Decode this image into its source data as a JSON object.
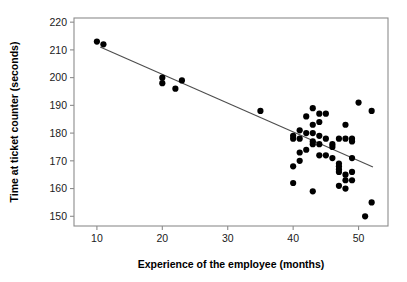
{
  "chart_data": {
    "type": "scatter",
    "title": "",
    "xlabel": "Experience of the employee (months)",
    "ylabel": "Time at ticket counter (seconds)",
    "xlim": [
      6.5,
      54.5
    ],
    "ylim": [
      146.5,
      221.5
    ],
    "xticks": [
      10,
      20,
      30,
      40,
      50
    ],
    "xtick_labels": [
      "10",
      "20",
      "30",
      "40",
      "50"
    ],
    "yticks": [
      150,
      160,
      170,
      180,
      190,
      200,
      210,
      220
    ],
    "ytick_labels": [
      "150",
      "160",
      "170",
      "180",
      "190",
      "200",
      "210",
      "220"
    ],
    "grid": false,
    "legend": false,
    "point_color": "#000000",
    "point_size": 3.1,
    "frame_color": "#8c8c8c",
    "series": [
      {
        "name": "Employees",
        "x": [
          10.0,
          11.0,
          20.0,
          20.0,
          22.0,
          23.0,
          35.0,
          40.0,
          40.0,
          40.0,
          40.0,
          41.0,
          41.0,
          41.0,
          41.0,
          42.0,
          42.0,
          42.0,
          43.0,
          43.0,
          43.0,
          43.0,
          43.0,
          43.0,
          44.0,
          44.0,
          44.0,
          44.0,
          44.0,
          45.0,
          45.0,
          45.0,
          46.0,
          46.0,
          46.0,
          47.0,
          47.0,
          47.0,
          47.0,
          47.0,
          47.0,
          48.0,
          48.0,
          48.0,
          48.0,
          48.0,
          49.0,
          49.0,
          49.0,
          49.0,
          49.0,
          50.0,
          51.0,
          52.0,
          52.0
        ],
        "y": [
          213.0,
          212.0,
          200.0,
          198.0,
          196.0,
          199.0,
          188.0,
          179.0,
          178.0,
          168.0,
          162.0,
          181.0,
          178.0,
          173.0,
          170.0,
          186.0,
          180.0,
          174.0,
          189.0,
          183.0,
          180.0,
          177.0,
          176.0,
          159.0,
          187.0,
          184.0,
          179.0,
          176.0,
          172.0,
          187.0,
          178.0,
          172.0,
          176.0,
          175.0,
          171.0,
          178.0,
          169.0,
          168.0,
          167.0,
          166.0,
          161.0,
          183.0,
          178.0,
          165.0,
          163.0,
          160.0,
          178.0,
          177.0,
          171.0,
          166.0,
          163.0,
          191.0,
          150.0,
          188.0,
          155.0
        ]
      }
    ],
    "trendline": {
      "name": "linear-fit",
      "x": [
        10.5,
        52.2
      ],
      "y": [
        211.0,
        167.8
      ],
      "color": "#4d4d4d"
    }
  }
}
